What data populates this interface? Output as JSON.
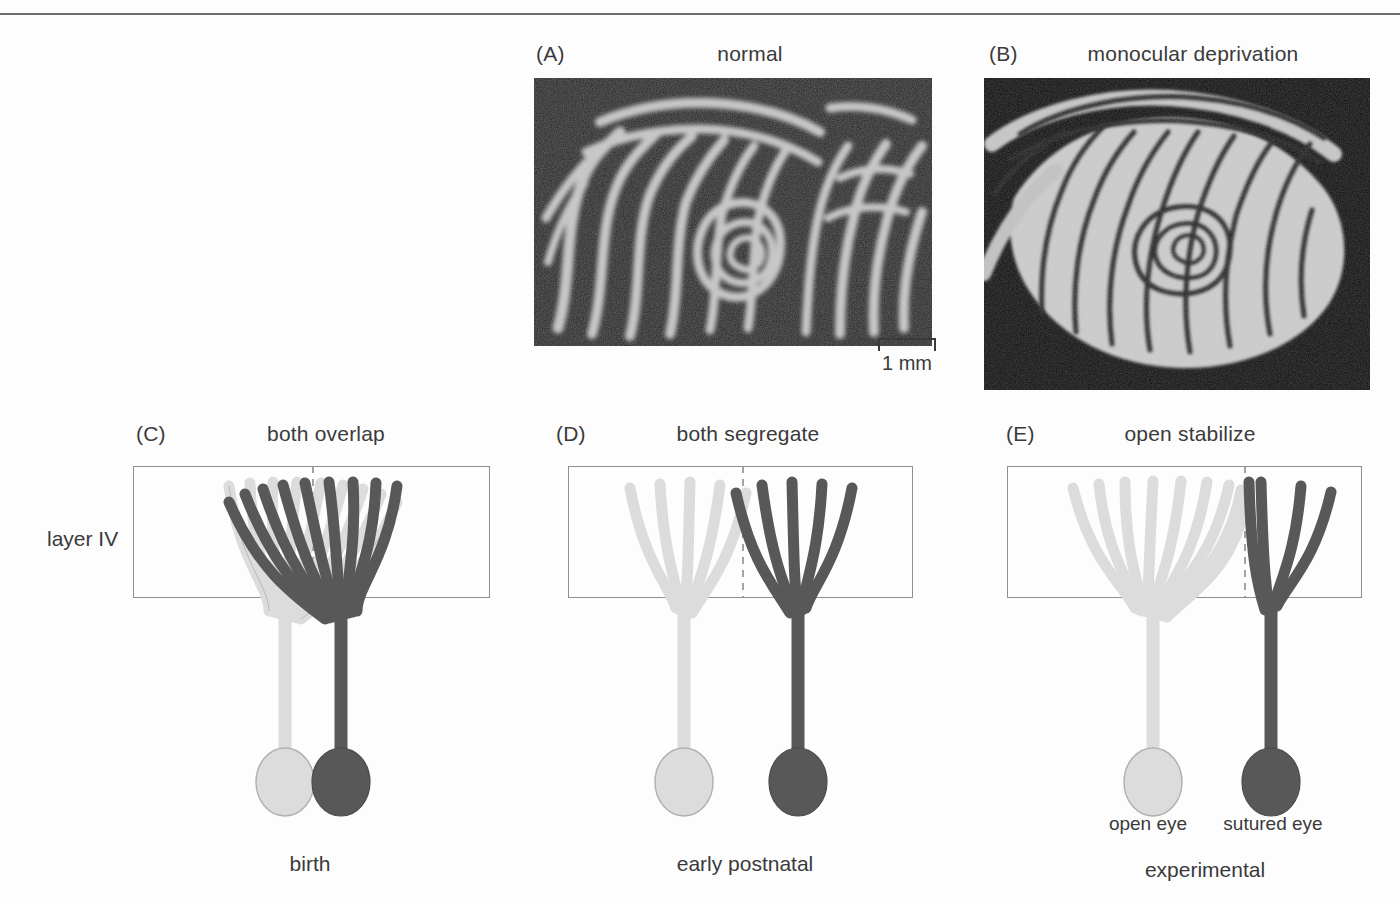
{
  "figure": {
    "background": "#fdfdfd",
    "rule_color": "#6e6e72"
  },
  "colors": {
    "light_arbor_fill": "#dcdcdc",
    "light_arbor_stroke": "#a8a8a8",
    "dark_arbor_fill": "#585858",
    "dark_arbor_stroke": "#4a4a4a",
    "box_stroke": "#8d8d92",
    "midline_stroke": "#8d8d92",
    "text": "#3a3a3a"
  },
  "panels": {
    "a": {
      "letter": "(A)",
      "title": "normal",
      "kind": "autoradiograph-micrograph",
      "description": "ocular dominance columns, normal animal"
    },
    "b": {
      "letter": "(B)",
      "title": "monocular deprivation",
      "kind": "autoradiograph-micrograph",
      "description": "ocular dominance columns, monocularly deprived animal"
    },
    "c": {
      "letter": "(C)",
      "title": "both overlap",
      "kind": "arbor-diagram",
      "left_branches": 9,
      "right_branches": 9,
      "stage": "birth"
    },
    "d": {
      "letter": "(D)",
      "title": "both segregate",
      "kind": "arbor-diagram",
      "left_branches": 5,
      "right_branches": 5,
      "stage": "early postnatal"
    },
    "e": {
      "letter": "(E)",
      "title": "open stabilize",
      "kind": "arbor-diagram",
      "left_branches": 9,
      "right_branches": 4,
      "stage": "experimental"
    }
  },
  "scalebar": {
    "label": "1 mm"
  },
  "labels": {
    "layer": "layer IV",
    "open_eye": "open eye",
    "sutured_eye": "sutured eye",
    "birth": "birth",
    "early_postnatal": "early postnatal",
    "experimental": "experimental"
  }
}
